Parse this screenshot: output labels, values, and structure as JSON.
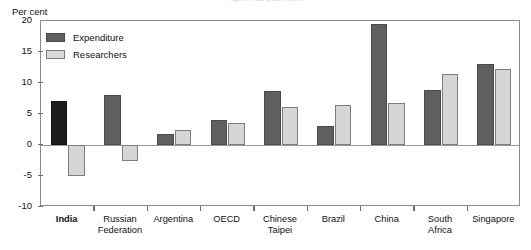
{
  "chart_title_faint": "Figure: R&D growth rates",
  "axis": {
    "y_title": "Per cent",
    "y_ticks": [
      20,
      15,
      10,
      5,
      0,
      -5,
      -10
    ]
  },
  "legend": {
    "items": [
      {
        "label": "Expenditure",
        "color": "#5f5f5f",
        "key": "expenditure"
      },
      {
        "label": "Researchers",
        "color": "#d9d9d9",
        "key": "researchers"
      }
    ]
  },
  "chart_data": {
    "type": "bar",
    "title": "",
    "xlabel": "",
    "ylabel": "Per cent",
    "ylim": [
      -10,
      20
    ],
    "ytick_step": 5,
    "grid": false,
    "legend_position": "top-left",
    "categories": [
      "India",
      "Russian\nFederation",
      "Argentina",
      "OECD",
      "Chinese\nTaipei",
      "Brazil",
      "China",
      "South\nAfrica",
      "Singapore"
    ],
    "highlight_category": "India",
    "series": [
      {
        "name": "Expenditure",
        "color": "#5f5f5f",
        "values": [
          7.1,
          8.0,
          1.7,
          4.0,
          8.7,
          3.0,
          19.5,
          8.8,
          13.0
        ]
      },
      {
        "name": "Researchers",
        "color": "#d9d9d9",
        "values": [
          -5.0,
          -2.6,
          2.5,
          3.6,
          6.1,
          6.5,
          6.7,
          11.5,
          12.3
        ]
      }
    ]
  }
}
